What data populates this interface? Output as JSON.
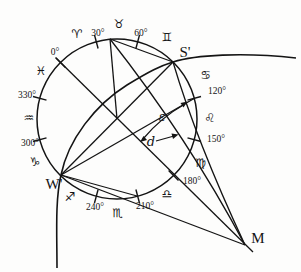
{
  "figure": {
    "ink_color": "#141414",
    "background_color": "#fdfdfc",
    "tick_degrees": [
      0,
      30,
      60,
      120,
      150,
      180,
      210,
      240,
      300,
      330
    ],
    "degree_labels": [
      {
        "deg": 0,
        "label": "0°",
        "x": 55,
        "y": 55
      },
      {
        "deg": 30,
        "label": "30°",
        "x": 98,
        "y": 36
      },
      {
        "deg": 60,
        "label": "60°",
        "x": 141,
        "y": 36
      },
      {
        "deg": 120,
        "label": "120°",
        "x": 217,
        "y": 94
      },
      {
        "deg": 150,
        "label": "150°",
        "x": 216,
        "y": 142
      },
      {
        "deg": 180,
        "label": "180°",
        "x": 192,
        "y": 184
      },
      {
        "deg": 210,
        "label": "210°",
        "x": 145,
        "y": 209
      },
      {
        "deg": 240,
        "label": "240°",
        "x": 95,
        "y": 210
      },
      {
        "deg": 300,
        "label": "300°",
        "x": 30,
        "y": 146
      },
      {
        "deg": 330,
        "label": "330°",
        "x": 27,
        "y": 98
      }
    ],
    "zodiac_signs": [
      {
        "name": "aries-icon",
        "glyph": "♈",
        "x": 77,
        "y": 38
      },
      {
        "name": "taurus-icon",
        "glyph": "♉",
        "x": 119,
        "y": 28
      },
      {
        "name": "gemini-icon",
        "glyph": "♊",
        "x": 167,
        "y": 41
      },
      {
        "name": "cancer-icon",
        "glyph": "♋",
        "x": 206,
        "y": 79
      },
      {
        "name": "leo-icon",
        "glyph": "♌",
        "x": 210,
        "y": 122
      },
      {
        "name": "virgo-icon",
        "glyph": "♍",
        "x": 201,
        "y": 167
      },
      {
        "name": "libra-icon",
        "glyph": "♎",
        "x": 167,
        "y": 198
      },
      {
        "name": "scorpio-icon",
        "glyph": "♏",
        "x": 118,
        "y": 217
      },
      {
        "name": "sagittarius-icon",
        "glyph": "♐",
        "x": 70,
        "y": 201
      },
      {
        "name": "capricorn-icon",
        "glyph": "♑",
        "x": 35,
        "y": 166
      },
      {
        "name": "aquarius-icon",
        "glyph": "♒",
        "x": 29,
        "y": 122
      },
      {
        "name": "pisces-icon",
        "glyph": "♓",
        "x": 41,
        "y": 75
      }
    ],
    "point_labels": [
      {
        "name": "point-S-label",
        "text": "S'",
        "x": 185,
        "y": 57
      },
      {
        "name": "point-W-label",
        "text": "W'",
        "x": 54,
        "y": 189
      },
      {
        "name": "point-M-label",
        "text": "M",
        "x": 258,
        "y": 243
      }
    ],
    "angle_labels": [
      {
        "name": "epsilon-label",
        "text": "ε",
        "x": 162,
        "y": 121
      },
      {
        "name": "d-label",
        "text": "d",
        "x": 151,
        "y": 146
      }
    ]
  }
}
